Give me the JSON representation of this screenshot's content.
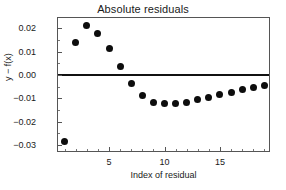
{
  "chart_data": {
    "type": "scatter",
    "title": "Absolute residuals",
    "xlabel": "Index of residual",
    "ylabel": "y − f(x)",
    "x": [
      1,
      2,
      3,
      4,
      5,
      6,
      7,
      8,
      9,
      10,
      11,
      12,
      13,
      14,
      15,
      16,
      17,
      18,
      19
    ],
    "values": [
      -0.0285,
      0.014,
      0.0212,
      0.0178,
      0.0112,
      0.0035,
      -0.0038,
      -0.0089,
      -0.0116,
      -0.0124,
      -0.0123,
      -0.0116,
      -0.0106,
      -0.0096,
      -0.0083,
      -0.0073,
      -0.0062,
      -0.0053,
      -0.0045
    ],
    "xlim": [
      0.4,
      19.6
    ],
    "ylim": [
      -0.0335,
      0.0245
    ],
    "xticks": [
      5,
      10,
      15
    ],
    "xtick_labels": [
      "5",
      "10",
      "15"
    ],
    "xticks_minor": [
      1,
      2,
      3,
      4,
      6,
      7,
      8,
      9,
      11,
      12,
      13,
      14,
      16,
      17,
      18,
      19
    ],
    "yticks": [
      0.02,
      0.01,
      0.0,
      -0.01,
      -0.02,
      -0.03
    ],
    "ytick_labels": [
      "0.02",
      "0.01",
      "0.00",
      "−0.01",
      "−0.02",
      "−0.03"
    ],
    "yticks_minor": [
      0.015,
      0.005,
      -0.005,
      -0.015,
      -0.025
    ],
    "grid": false,
    "legend": null,
    "reference_line": {
      "name": "zero-line",
      "orientation": "horizontal",
      "y": 0.0
    },
    "marker": {
      "shape": "circle",
      "color": "#0d0d0d",
      "size": 7
    },
    "frame_color": "#555555",
    "background": "#ffffff"
  }
}
